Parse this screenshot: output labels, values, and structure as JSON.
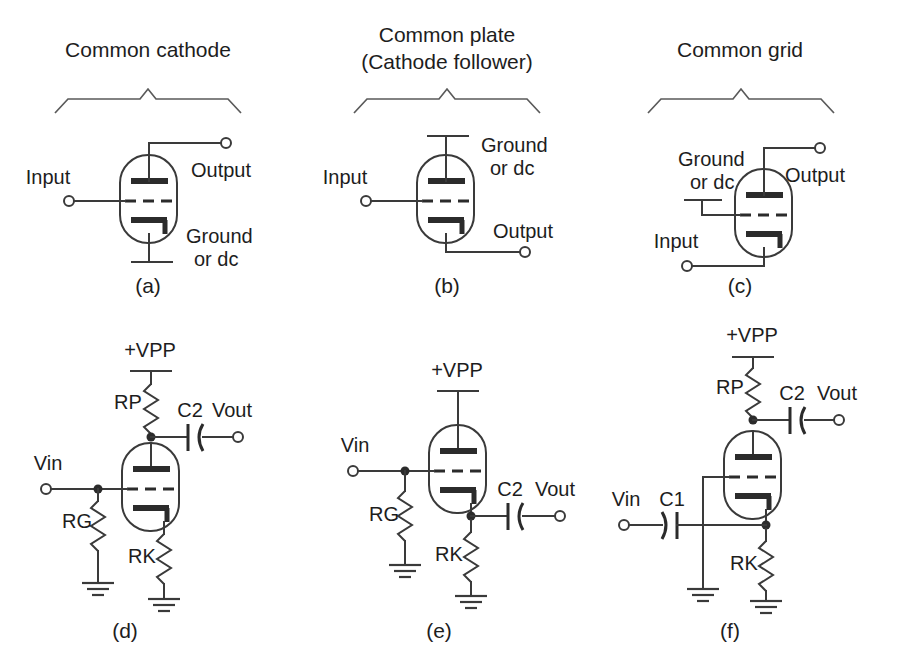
{
  "figure": {
    "kind": "vacuum-tube-amplifier-configurations",
    "panel_count": 6,
    "colors": {
      "background": "#ffffff",
      "wire": "#3a3a3a",
      "electrode": "#2b2b2b",
      "text": "#1d1d1d",
      "brace": "#5a5a5a"
    }
  },
  "panels": {
    "a": {
      "id": "(a)",
      "title": "Common cathode",
      "title_line2": "",
      "labels": {
        "input": "Input",
        "output": "Output",
        "ground": "Ground",
        "ground2": "or dc"
      }
    },
    "b": {
      "id": "(b)",
      "title": "Common plate",
      "title_line2": "(Cathode follower)",
      "labels": {
        "input": "Input",
        "output": "Output",
        "ground": "Ground",
        "ground2": "or dc"
      }
    },
    "c": {
      "id": "(c)",
      "title": "Common grid",
      "title_line2": "",
      "labels": {
        "input": "Input",
        "output": "Output",
        "ground": "Ground",
        "ground2": "or dc"
      }
    },
    "d": {
      "id": "(d)",
      "labels": {
        "supply": "+VPP",
        "vin": "Vin",
        "vout": "Vout",
        "rp": "RP",
        "rg": "RG",
        "rk": "RK",
        "c2": "C2"
      }
    },
    "e": {
      "id": "(e)",
      "labels": {
        "supply": "+VPP",
        "vin": "Vin",
        "vout": "Vout",
        "rg": "RG",
        "rk": "RK",
        "c2": "C2"
      }
    },
    "f": {
      "id": "(f)",
      "labels": {
        "supply": "+VPP",
        "vin": "Vin",
        "vout": "Vout",
        "rp": "RP",
        "rk": "RK",
        "c1": "C1",
        "c2": "C2"
      }
    }
  }
}
